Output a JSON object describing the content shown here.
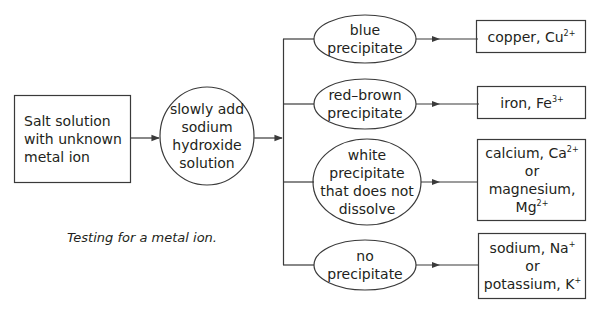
{
  "diagram": {
    "caption": "Testing for a metal ion.",
    "start": {
      "lines": [
        "Salt solution",
        "with unknown",
        "metal ion"
      ]
    },
    "process": {
      "lines": [
        "slowly add",
        "sodium",
        "hydroxide",
        "solution"
      ]
    },
    "branches": [
      {
        "observation": [
          "blue",
          "precipitate"
        ],
        "result": [
          {
            "text": "copper, Cu",
            "sup": "2+"
          }
        ]
      },
      {
        "observation": [
          "red–brown",
          "precipitate"
        ],
        "result": [
          {
            "text": "iron, Fe",
            "sup": "3+"
          }
        ]
      },
      {
        "observation": [
          "white",
          "precipitate",
          "that does not",
          "dissolve"
        ],
        "result": [
          {
            "text": "calcium, Ca",
            "sup": "2+"
          },
          {
            "text": "or",
            "sup": ""
          },
          {
            "text": "magnesium,",
            "sup": ""
          },
          {
            "text": "Mg",
            "sup": "2+"
          }
        ]
      },
      {
        "observation": [
          "no",
          "precipitate"
        ],
        "result": [
          {
            "text": "sodium, Na",
            "sup": "+"
          },
          {
            "text": "or",
            "sup": ""
          },
          {
            "text": "potassium, K",
            "sup": "+"
          }
        ]
      }
    ],
    "colors": {
      "line": "#3a3a3a",
      "text": "#231f20",
      "background": "#ffffff"
    }
  }
}
